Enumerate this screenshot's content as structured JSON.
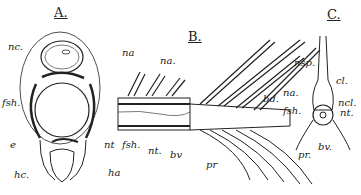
{
  "figure": {
    "panels": [
      {
        "id": "A",
        "title": "A."
      },
      {
        "id": "B",
        "title": "B."
      },
      {
        "id": "C",
        "title": "C."
      }
    ],
    "labels": {
      "A": {
        "nc": "nc.",
        "na": "na",
        "fsh": "fsh.",
        "e": "e",
        "nt": "nt",
        "hc": "hc.",
        "ha": "ha"
      },
      "B": {
        "na": "na.",
        "fsh": "fsh.",
        "nt": "nt.",
        "bv": "bv",
        "pr": "pr",
        "bd": "bd."
      },
      "C": {
        "nsp": "nsp.",
        "cl": "cl.",
        "na": "na.",
        "ncl": "ncl.",
        "fsh": "fsh.",
        "nt": "nt.",
        "bv": "bv.",
        "pr": "pr."
      }
    }
  }
}
